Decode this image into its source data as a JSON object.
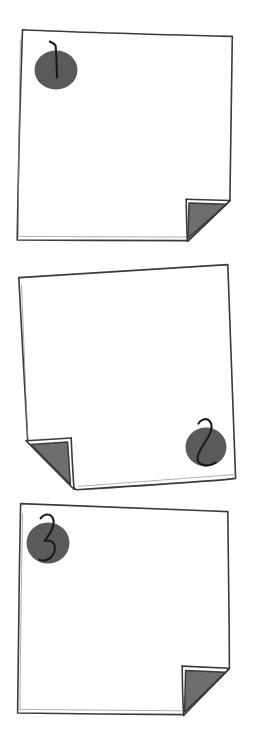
{
  "scene": {
    "title": "Numbered paper cards",
    "description": "Three hand-drawn paper sheets, each with a gray circular sticker showing a handwritten number and one folded-over corner",
    "background_color": "#ffffff",
    "card_count": 3
  },
  "palette": {
    "paper_fill": "#ffffff",
    "outline": "#3a3a3a",
    "outline_soft": "#8c8c8c",
    "sticker_fill": "#5a5a5a",
    "fold_fill": "#6e6e6e",
    "digit_ink": "#1a1a1a"
  },
  "cards": [
    {
      "id": "card-1",
      "number": "1",
      "sticker_position": "top-left",
      "fold_position": "bottom-right",
      "sticker_center": {
        "x": 56,
        "y": 70
      },
      "sticker_radius": 21
    },
    {
      "id": "card-2",
      "number": "2",
      "sticker_position": "bottom-right",
      "fold_position": "bottom-left",
      "sticker_center": {
        "x": 206,
        "y": 447
      },
      "sticker_radius": 20
    },
    {
      "id": "card-3",
      "number": "3",
      "sticker_position": "top-left",
      "fold_position": "bottom-right",
      "sticker_center": {
        "x": 48,
        "y": 543
      },
      "sticker_radius": 21
    }
  ]
}
